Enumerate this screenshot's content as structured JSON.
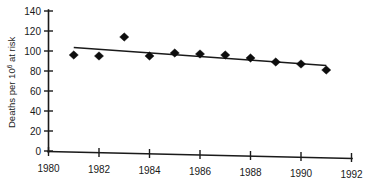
{
  "chart_data": {
    "type": "scatter",
    "title": "",
    "subtitle": "",
    "xlabel": "",
    "ylabel": "Deaths per 10",
    "ylabel_superscript": "6",
    "ylabel_suffix": " at risk",
    "ylabel_full": "Deaths per 10^6 at risk",
    "x": [
      1981,
      1982,
      1983,
      1984,
      1985,
      1986,
      1987,
      1988,
      1989,
      1990,
      1991
    ],
    "values": [
      96,
      95,
      114,
      95,
      98,
      97,
      96,
      93,
      89,
      87,
      81
    ],
    "series": [
      {
        "name": "Deaths per 10^6 at risk",
        "marker": "filled-diamond",
        "color": "#0d0d0d",
        "points": [
          {
            "x": 1981,
            "y": 96
          },
          {
            "x": 1982,
            "y": 95
          },
          {
            "x": 1983,
            "y": 114
          },
          {
            "x": 1984,
            "y": 95
          },
          {
            "x": 1985,
            "y": 98
          },
          {
            "x": 1986,
            "y": 97
          },
          {
            "x": 1987,
            "y": 96
          },
          {
            "x": 1988,
            "y": 93
          },
          {
            "x": 1989,
            "y": 89
          },
          {
            "x": 1990,
            "y": 87
          },
          {
            "x": 1991,
            "y": 81
          }
        ]
      }
    ],
    "trend_line": {
      "name": "fitted-trend",
      "color": "#1a1a1a",
      "x_start": 1981,
      "y_start": 103.5,
      "x_end": 1991,
      "y_end": 85.5
    },
    "xlim": [
      1980,
      1992
    ],
    "ylim": [
      0,
      140
    ],
    "xticks": [
      1980,
      1982,
      1984,
      1986,
      1988,
      1990,
      1992
    ],
    "xticklabels": [
      "1980",
      "1982",
      "1984",
      "1986",
      "1988",
      "1990",
      "1992"
    ],
    "yticks": [
      0,
      20,
      40,
      60,
      80,
      100,
      120,
      140
    ],
    "yticklabels": [
      "0",
      "20",
      "40",
      "60",
      "80",
      "100",
      "120",
      "140"
    ],
    "grid": false,
    "legend": "none",
    "annotations": []
  },
  "axes": {
    "y_tick_labels": [
      "140",
      "120",
      "100",
      "80",
      "60",
      "40",
      "20",
      "0"
    ],
    "x_tick_labels": [
      "1980",
      "1982",
      "1984",
      "1986",
      "1988",
      "1990",
      "1992"
    ]
  },
  "colors": {
    "marker": "#0d0d0d",
    "axis": "#1a1a1a",
    "trend": "#1a1a1a",
    "background": "#ffffff"
  }
}
